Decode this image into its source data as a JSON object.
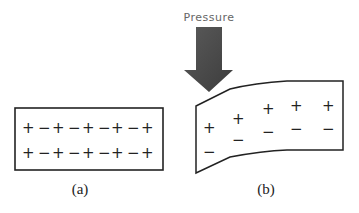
{
  "figure": {
    "panel_a": {
      "label": "(a)",
      "rows": [
        [
          "+",
          "−",
          "+",
          "−",
          "+",
          "−",
          "+",
          "−",
          "+"
        ],
        [
          "+",
          "−",
          "+",
          "−",
          "+",
          "−",
          "+",
          "−",
          "+"
        ]
      ]
    },
    "panel_b": {
      "label": "(b)",
      "pressure_label": "Pressure",
      "plus_row": [
        "+",
        "+",
        "+",
        "+",
        "+"
      ],
      "minus_row": [
        "−",
        "−",
        "−",
        "−",
        "−"
      ]
    },
    "colors": {
      "arrow": "#4a4a4a",
      "stroke": "#222222"
    }
  }
}
